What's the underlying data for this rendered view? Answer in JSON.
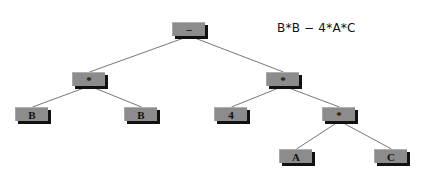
{
  "expression": "B*B − 4*A*C",
  "colors": {
    "node_fill": "#8c8c8c",
    "node_shadow": "#111111",
    "edge": "#777777",
    "text": "#111111",
    "background": "#ffffff"
  },
  "tree": {
    "nodes": [
      {
        "id": "root",
        "label": "−",
        "x": 172,
        "y": 22
      },
      {
        "id": "mul_left",
        "label": "*",
        "x": 72,
        "y": 72
      },
      {
        "id": "mul_right",
        "label": "*",
        "x": 266,
        "y": 72
      },
      {
        "id": "b1",
        "label": "B",
        "x": 15,
        "y": 107
      },
      {
        "id": "b2",
        "label": "B",
        "x": 124,
        "y": 107
      },
      {
        "id": "four",
        "label": "4",
        "x": 214,
        "y": 107
      },
      {
        "id": "mul_inner",
        "label": "*",
        "x": 322,
        "y": 107
      },
      {
        "id": "a",
        "label": "A",
        "x": 279,
        "y": 149
      },
      {
        "id": "c",
        "label": "C",
        "x": 374,
        "y": 149
      }
    ],
    "edges": [
      [
        "root",
        "mul_left"
      ],
      [
        "root",
        "mul_right"
      ],
      [
        "mul_left",
        "b1"
      ],
      [
        "mul_left",
        "b2"
      ],
      [
        "mul_right",
        "four"
      ],
      [
        "mul_right",
        "mul_inner"
      ],
      [
        "mul_inner",
        "a"
      ],
      [
        "mul_inner",
        "c"
      ]
    ]
  }
}
